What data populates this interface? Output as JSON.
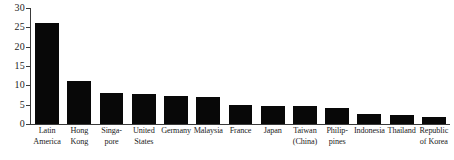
{
  "chart_data": {
    "type": "bar",
    "title": "",
    "xlabel": "",
    "ylabel": "",
    "ylim": [
      0,
      30
    ],
    "ytick_values": [
      0,
      5,
      10,
      15,
      20,
      25,
      30
    ],
    "ytick_labels": [
      "0",
      "5",
      "10",
      "15",
      "20",
      "25",
      "30"
    ],
    "grid": false,
    "legend": false,
    "bar_color": "#080808",
    "axis_color": "#3a3a3a",
    "categories": [
      "Latin\nAmerica",
      "Hong\nKong",
      "Singa-\npore",
      "United\nStates",
      "Germany",
      "Malaysia",
      "France",
      "Japan",
      "Taiwan\n(China)",
      "Philip-\npines",
      "Indonesia",
      "Thailand",
      "Republic\nof Korea"
    ],
    "values": [
      26.0,
      11.1,
      8.1,
      7.8,
      7.3,
      7.1,
      5.0,
      4.7,
      4.6,
      4.2,
      2.7,
      2.4,
      1.8
    ]
  }
}
